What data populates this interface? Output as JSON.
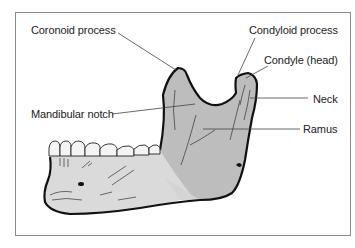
{
  "diagram": {
    "labels": [
      {
        "id": "coronoid",
        "text": "Coronoid process"
      },
      {
        "id": "condyloid",
        "text": "Condyloid process"
      },
      {
        "id": "condyle",
        "text": "Condyle (head)"
      },
      {
        "id": "notch",
        "text": "Mandibular notch"
      },
      {
        "id": "neck",
        "text": "Neck"
      },
      {
        "id": "ramus",
        "text": "Ramus"
      }
    ],
    "colors": {
      "bone_fill": "#c8c8c8",
      "ramus_shade": "#b4b4b4",
      "body_fill": "#d9d9d9",
      "outline": "#111111",
      "leader": "#444444",
      "frame": "#8a8a8a"
    }
  }
}
